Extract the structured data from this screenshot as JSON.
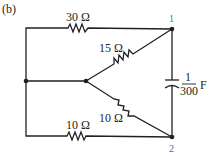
{
  "figure_label": "(b)",
  "nodes": {
    "n1": "1",
    "n2": "2"
  },
  "components": {
    "r_top": "30 Ω",
    "r_upper_diag": "15 Ω",
    "r_lower_diag": "10 Ω",
    "r_bottom": "10 Ω",
    "cap_num": "1",
    "cap_den": "300",
    "cap_unit": "F"
  },
  "colors": {
    "wire": "#231f20",
    "node_label": "#4a6fa5"
  }
}
